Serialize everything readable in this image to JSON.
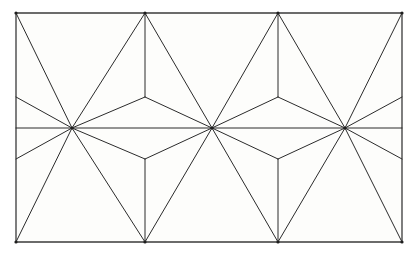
{
  "figure": {
    "canvas": {
      "width": 414,
      "height": 257
    },
    "colors": {
      "background": "#ffffff",
      "plate": "#fdfdfb",
      "line": "#2b2b2b",
      "frame": "#3a3a3a",
      "hub_dot": "#1e1e1e"
    },
    "style": {
      "line_width": 1,
      "frame_width": 1.3,
      "fill": "none"
    }
  },
  "chart_data": {
    "type": "line",
    "xlabel": "",
    "ylabel": "",
    "xlim": [
      16,
      402
    ],
    "ylim": [
      13,
      242
    ],
    "grid": false,
    "legend": "none",
    "frame": {
      "x0": 16,
      "y0": 13,
      "x1": 402,
      "y1": 242
    },
    "midline_y": 128,
    "hub_spokes": 12,
    "vertices": {
      "full_hubs": [
        {
          "name": "hub-left",
          "x": 72,
          "y": 128
        },
        {
          "name": "hub-center",
          "x": 212,
          "y": 128
        },
        {
          "name": "hub-right",
          "x": 345,
          "y": 128
        }
      ],
      "top_hubs": [
        {
          "name": "top-hub-0",
          "x": 16,
          "y": 13
        },
        {
          "name": "top-hub-1",
          "x": 145,
          "y": 13
        },
        {
          "name": "top-hub-2",
          "x": 278,
          "y": 13
        },
        {
          "name": "top-hub-3",
          "x": 402,
          "y": 13
        }
      ],
      "bottom_hubs": [
        {
          "name": "bottom-hub-0",
          "x": 16,
          "y": 242
        },
        {
          "name": "bottom-hub-1",
          "x": 145,
          "y": 242
        },
        {
          "name": "bottom-hub-2",
          "x": 278,
          "y": 242
        },
        {
          "name": "bottom-hub-3",
          "x": 402,
          "y": 242
        }
      ],
      "upper_y_junctions": [
        {
          "name": "y-junction-upper-1",
          "x": 145,
          "y": 97
        },
        {
          "name": "y-junction-upper-2",
          "x": 278,
          "y": 97
        }
      ],
      "lower_y_junctions": [
        {
          "name": "y-junction-lower-1",
          "x": 145,
          "y": 159
        },
        {
          "name": "y-junction-lower-2",
          "x": 278,
          "y": 159
        }
      ],
      "left_edge_nodes": [
        {
          "name": "left-edge-upper",
          "x": 16,
          "y": 97
        },
        {
          "name": "left-edge-lower",
          "x": 16,
          "y": 159
        }
      ],
      "right_edge_nodes": [
        {
          "name": "right-edge-upper",
          "x": 402,
          "y": 97
        },
        {
          "name": "right-edge-lower",
          "x": 402,
          "y": 159
        }
      ]
    },
    "segments": [
      {
        "name": "frame-top",
        "x1": 16,
        "y1": 13,
        "x2": 402,
        "y2": 13
      },
      {
        "name": "frame-bottom",
        "x1": 16,
        "y1": 242,
        "x2": 402,
        "y2": 242
      },
      {
        "name": "frame-left",
        "x1": 16,
        "y1": 13,
        "x2": 16,
        "y2": 242
      },
      {
        "name": "frame-right",
        "x1": 402,
        "y1": 13,
        "x2": 402,
        "y2": 242
      },
      {
        "name": "midline",
        "x1": 16,
        "y1": 128,
        "x2": 402,
        "y2": 128
      },
      {
        "name": "hubL-to-topA",
        "x1": 72,
        "y1": 128,
        "x2": 16,
        "y2": 13
      },
      {
        "name": "hubL-to-topB",
        "x1": 72,
        "y1": 128,
        "x2": 145,
        "y2": 13
      },
      {
        "name": "hubL-to-yU",
        "x1": 72,
        "y1": 128,
        "x2": 145,
        "y2": 97
      },
      {
        "name": "hubL-to-leU",
        "x1": 72,
        "y1": 128,
        "x2": 16,
        "y2": 97
      },
      {
        "name": "hubL-to-botA",
        "x1": 72,
        "y1": 128,
        "x2": 16,
        "y2": 242
      },
      {
        "name": "hubL-to-botB",
        "x1": 72,
        "y1": 128,
        "x2": 145,
        "y2": 242
      },
      {
        "name": "hubL-to-yL",
        "x1": 72,
        "y1": 128,
        "x2": 145,
        "y2": 159
      },
      {
        "name": "hubL-to-leL",
        "x1": 72,
        "y1": 128,
        "x2": 16,
        "y2": 159
      },
      {
        "name": "hubC-to-topB",
        "x1": 212,
        "y1": 128,
        "x2": 145,
        "y2": 13
      },
      {
        "name": "hubC-to-topC",
        "x1": 212,
        "y1": 128,
        "x2": 278,
        "y2": 13
      },
      {
        "name": "hubC-to-yU1",
        "x1": 212,
        "y1": 128,
        "x2": 145,
        "y2": 97
      },
      {
        "name": "hubC-to-yU2",
        "x1": 212,
        "y1": 128,
        "x2": 278,
        "y2": 97
      },
      {
        "name": "hubC-to-botB",
        "x1": 212,
        "y1": 128,
        "x2": 145,
        "y2": 242
      },
      {
        "name": "hubC-to-botC",
        "x1": 212,
        "y1": 128,
        "x2": 278,
        "y2": 242
      },
      {
        "name": "hubC-to-yL1",
        "x1": 212,
        "y1": 128,
        "x2": 145,
        "y2": 159
      },
      {
        "name": "hubC-to-yL2",
        "x1": 212,
        "y1": 128,
        "x2": 278,
        "y2": 159
      },
      {
        "name": "hubR-to-topC",
        "x1": 345,
        "y1": 128,
        "x2": 278,
        "y2": 13
      },
      {
        "name": "hubR-to-topD",
        "x1": 345,
        "y1": 128,
        "x2": 402,
        "y2": 13
      },
      {
        "name": "hubR-to-yU2",
        "x1": 345,
        "y1": 128,
        "x2": 278,
        "y2": 97
      },
      {
        "name": "hubR-to-reU",
        "x1": 345,
        "y1": 128,
        "x2": 402,
        "y2": 97
      },
      {
        "name": "hubR-to-botC",
        "x1": 345,
        "y1": 128,
        "x2": 278,
        "y2": 242
      },
      {
        "name": "hubR-to-botD",
        "x1": 345,
        "y1": 128,
        "x2": 402,
        "y2": 242
      },
      {
        "name": "hubR-to-yL2",
        "x1": 345,
        "y1": 128,
        "x2": 278,
        "y2": 159
      },
      {
        "name": "hubR-to-reL",
        "x1": 345,
        "y1": 128,
        "x2": 402,
        "y2": 159
      },
      {
        "name": "stem-upper-1",
        "x1": 145,
        "y1": 13,
        "x2": 145,
        "y2": 97
      },
      {
        "name": "stem-upper-2",
        "x1": 278,
        "y1": 13,
        "x2": 278,
        "y2": 97
      },
      {
        "name": "stem-lower-1",
        "x1": 145,
        "y1": 159,
        "x2": 145,
        "y2": 242
      },
      {
        "name": "stem-lower-2",
        "x1": 278,
        "y1": 159,
        "x2": 278,
        "y2": 242
      },
      {
        "name": "edge-left-up-h",
        "x1": 16,
        "y1": 97,
        "x2": 16,
        "y2": 97
      },
      {
        "name": "edge-right-up-h",
        "x1": 402,
        "y1": 97,
        "x2": 402,
        "y2": 97
      }
    ]
  }
}
